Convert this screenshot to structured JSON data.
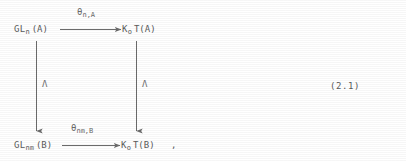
{
  "diagram": {
    "type": "commutative-square",
    "equation_number": "(2.1)",
    "trailing_punctuation": ",",
    "nodes": {
      "top_left": {
        "base": "GL",
        "sub": "n",
        "arg": "(A)"
      },
      "top_right": {
        "base": "K",
        "sub": "o",
        "arg": "T(A)"
      },
      "bottom_left": {
        "base": "GL",
        "sub": "nm",
        "arg": "(B)"
      },
      "bottom_right": {
        "base": "K",
        "sub": "o",
        "arg": "T(B)"
      }
    },
    "arrows": {
      "top": {
        "label_base": "θ",
        "label_sub": "n,A",
        "direction": "right"
      },
      "bottom": {
        "label_base": "θ",
        "label_sub": "nm,B",
        "direction": "right"
      },
      "left": {
        "label": "Λ",
        "direction": "down"
      },
      "right": {
        "label": "Λ",
        "direction": "down"
      }
    }
  },
  "colors": {
    "background": "#ffffff",
    "ink": "#5b5b5b",
    "arrow": "#6b6b6b"
  }
}
